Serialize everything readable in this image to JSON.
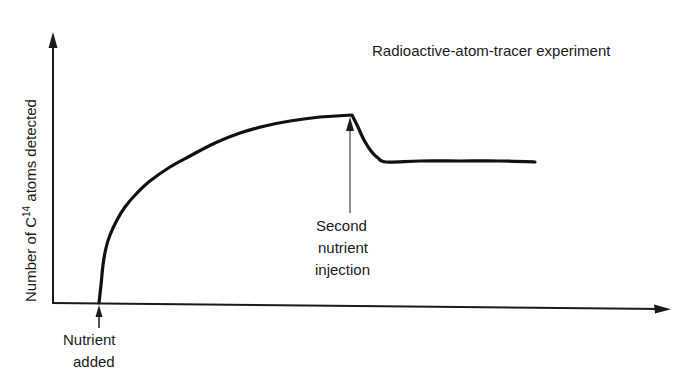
{
  "chart_data": {
    "type": "line",
    "title": "Radioactive-atom-tracer experiment",
    "xlabel": "",
    "ylabel": "Number of C14 atoms detected",
    "ylabel_parts": {
      "prefix": "Number of C",
      "superscript": "14",
      "suffix": " atoms detected"
    },
    "grid": false,
    "legend": null,
    "axes": {
      "x_ticks": [],
      "y_ticks": [],
      "arrowheads": true
    },
    "series": [
      {
        "name": "C14 atoms detected",
        "description": "Zero until nutrient added; rises steeply then levels off toward a maximum; at second nutrient injection it drops quickly to a lower plateau that remains constant.",
        "points_px": [
          [
            99,
            303
          ],
          [
            101,
            285
          ],
          [
            103,
            265
          ],
          [
            106,
            248
          ],
          [
            110,
            235
          ],
          [
            117,
            220
          ],
          [
            125,
            207
          ],
          [
            137,
            193
          ],
          [
            150,
            181
          ],
          [
            170,
            167
          ],
          [
            190,
            156
          ],
          [
            215,
            143
          ],
          [
            240,
            133
          ],
          [
            265,
            126
          ],
          [
            290,
            121
          ],
          [
            320,
            117
          ],
          [
            352,
            115
          ],
          [
            358,
            127
          ],
          [
            364,
            140
          ],
          [
            371,
            151
          ],
          [
            378,
            158
          ],
          [
            386,
            162
          ],
          [
            420,
            161
          ],
          [
            460,
            161
          ],
          [
            500,
            161
          ],
          [
            535,
            162
          ]
        ],
        "relative_values": {
          "x": [
            0,
            0.5,
            1,
            2,
            3,
            4,
            5,
            5.2,
            5.6,
            6,
            8,
            9
          ],
          "y": [
            0,
            0.6,
            0.72,
            0.82,
            0.88,
            0.92,
            0.94,
            0.8,
            0.74,
            0.73,
            0.73,
            0.73
          ]
        }
      }
    ],
    "annotations": [
      {
        "id": "nutrient_added",
        "lines": [
          "Nutrient",
          "added"
        ],
        "arrow_to_px": [
          99,
          305
        ]
      },
      {
        "id": "second_injection",
        "lines": [
          "Second",
          "nutrient",
          "injection"
        ],
        "arrow_to_px": [
          350,
          117
        ]
      }
    ]
  }
}
